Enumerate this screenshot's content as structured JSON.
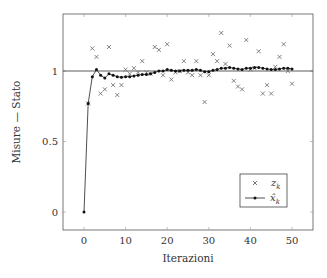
{
  "chart_data": {
    "type": "line",
    "title": "",
    "xlabel": "Iterazioni",
    "ylabel": "Misure — Stato",
    "xlim": [
      -5,
      55
    ],
    "ylim": [
      -0.13,
      1.38
    ],
    "xticks": [
      0,
      10,
      20,
      30,
      40,
      50
    ],
    "yticks": [
      0,
      0.5,
      1
    ],
    "ytick_labels": [
      "0",
      "0.5",
      "1"
    ],
    "grid": false,
    "reference_line": {
      "y": 1.0,
      "label": "true state"
    },
    "legend": {
      "position": "lower right",
      "entries": [
        "z_k",
        "x̂_k"
      ]
    },
    "series": [
      {
        "name": "z_k",
        "style": "markers-x",
        "x": [
          1,
          2,
          3,
          4,
          5,
          6,
          7,
          8,
          9,
          10,
          11,
          12,
          13,
          14,
          15,
          16,
          17,
          18,
          19,
          20,
          21,
          22,
          23,
          24,
          25,
          26,
          27,
          28,
          29,
          30,
          31,
          32,
          33,
          34,
          35,
          36,
          37,
          38,
          39,
          40,
          41,
          42,
          43,
          44,
          45,
          46,
          47,
          48,
          49,
          50
        ],
        "values": [
          0.77,
          1.16,
          1.1,
          0.84,
          0.87,
          1.17,
          0.9,
          0.83,
          0.9,
          1.01,
          0.98,
          1.02,
          0.99,
          1.07,
          0.99,
          0.98,
          1.17,
          1.15,
          0.97,
          1.19,
          0.94,
          0.99,
          1.0,
          1.07,
          0.99,
          0.97,
          1.07,
          0.97,
          0.78,
          0.97,
          1.12,
          1.07,
          1.27,
          1.05,
          1.18,
          0.93,
          0.89,
          0.87,
          1.22,
          1.01,
          1.02,
          1.14,
          0.84,
          0.9,
          0.84,
          1.03,
          1.1,
          1.19,
          1.0,
          0.91
        ]
      },
      {
        "name": "x̂_k",
        "style": "line-dots",
        "x": [
          0,
          1,
          2,
          3,
          4,
          5,
          6,
          7,
          8,
          9,
          10,
          11,
          12,
          13,
          14,
          15,
          16,
          17,
          18,
          19,
          20,
          21,
          22,
          23,
          24,
          25,
          26,
          27,
          28,
          29,
          30,
          31,
          32,
          33,
          34,
          35,
          36,
          37,
          38,
          39,
          40,
          41,
          42,
          43,
          44,
          45,
          46,
          47,
          48,
          49,
          50
        ],
        "values": [
          0,
          0.77,
          0.96,
          1.01,
          0.97,
          0.95,
          0.98,
          0.97,
          0.96,
          0.955,
          0.96,
          0.96,
          0.965,
          0.97,
          0.975,
          0.975,
          0.98,
          0.99,
          1.0,
          1.0,
          1.01,
          1.005,
          1.0,
          1.0,
          1.005,
          1.005,
          1.005,
          1.01,
          1.005,
          0.995,
          0.995,
          1.005,
          1.01,
          1.02,
          1.02,
          1.025,
          1.02,
          1.015,
          1.01,
          1.02,
          1.02,
          1.025,
          1.025,
          1.02,
          1.015,
          1.01,
          1.01,
          1.015,
          1.02,
          1.02,
          1.015
        ]
      }
    ]
  },
  "axes": {
    "xlabel": "Iterazioni",
    "ylabel": "Misure — Stato"
  },
  "legend": {
    "entry_measure": "z",
    "entry_measure_sub": "k",
    "entry_estimate": "x̂",
    "entry_estimate_sub": "k"
  }
}
